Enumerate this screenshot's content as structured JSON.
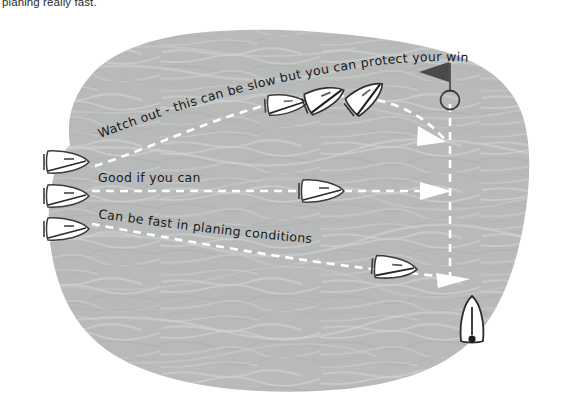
{
  "page": {
    "top_caption": "planing really fast."
  },
  "colors": {
    "water_fill": "#b9bbba",
    "water_streak_light": "#cfd1d0",
    "water_streak_dark": "#aeb0af",
    "route_dash": "#ffffff",
    "boat_outline": "#3b3b3b",
    "boat_fill": "#ffffff",
    "mark_flag": "#4a4a4a",
    "text": "#1a1a1a",
    "background": "#ffffff"
  },
  "annotations": [
    {
      "id": "route-upper-label",
      "text": "Watch out - this can be slow but you can protect your wind",
      "route": "upper"
    },
    {
      "id": "route-middle-label",
      "text": "Good if you can",
      "route": "middle"
    },
    {
      "id": "route-lower-label",
      "text": "Can be fast in planing conditions",
      "route": "lower"
    }
  ],
  "routes": [
    {
      "id": "upper",
      "name": "high-reaching-route",
      "style": "dashed-white",
      "arrow": true
    },
    {
      "id": "middle",
      "name": "rhumb-line-route",
      "style": "dashed-white",
      "arrow": true
    },
    {
      "id": "lower",
      "name": "low-planing-route",
      "style": "dashed-white",
      "arrow": true
    },
    {
      "id": "layline",
      "name": "vertical-layline",
      "style": "dashed-white",
      "arrow": false
    }
  ],
  "boats": [
    {
      "id": "start-upper",
      "name": "boat-start-upper",
      "heading_deg": 0
    },
    {
      "id": "start-middle",
      "name": "boat-start-middle",
      "heading_deg": 0
    },
    {
      "id": "start-lower",
      "name": "boat-start-lower",
      "heading_deg": 0
    },
    {
      "id": "upper-1",
      "name": "boat-upper-run-1",
      "heading_deg": 0
    },
    {
      "id": "upper-2",
      "name": "boat-upper-run-2",
      "heading_deg": -20
    },
    {
      "id": "upper-3",
      "name": "boat-upper-run-3",
      "heading_deg": -35
    },
    {
      "id": "middle-1",
      "name": "boat-middle-run",
      "heading_deg": 0
    },
    {
      "id": "lower-1",
      "name": "boat-lower-run",
      "heading_deg": 0
    },
    {
      "id": "at-mark",
      "name": "boat-approaching-mark",
      "heading_deg": -90
    }
  ],
  "mark": {
    "id": "windward-mark",
    "name": "course-mark-buoy",
    "has_flag": true
  }
}
